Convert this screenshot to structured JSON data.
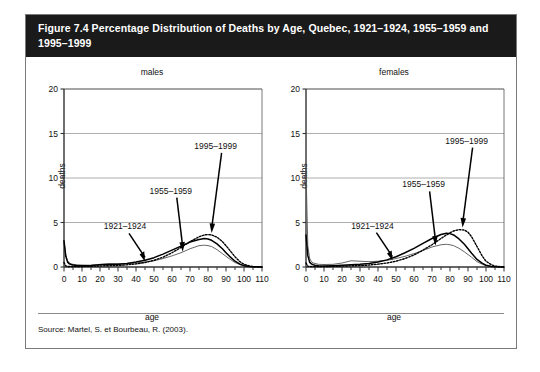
{
  "figure": {
    "title": "Figure 7.4 Percentage Distribution of Deaths by Age, Quebec, 1921–1924, 1955–1959 and 1995–1999",
    "source": "Source: Martel, S. et Bourbeau, R. (2003)."
  },
  "chart_data": [
    {
      "type": "line",
      "title": "males",
      "xlabel": "age",
      "ylabel": "deaths",
      "xlim": [
        0,
        110
      ],
      "ylim": [
        0,
        20
      ],
      "xticks": [
        0,
        10,
        20,
        30,
        40,
        50,
        60,
        70,
        80,
        90,
        100,
        110
      ],
      "yticks": [
        0,
        5,
        10,
        15,
        20
      ],
      "minor_xtick_step": 5,
      "grid": "horizontal",
      "legend_position": "annotations-with-arrows",
      "annotations": [
        {
          "label": "1921–1924",
          "points_to_age": 45,
          "points_to_value": 0.4
        },
        {
          "label": "1955–1959",
          "points_to_age": 66,
          "points_to_value": 1.5
        },
        {
          "label": "1995–1999",
          "points_to_age": 82,
          "points_to_value": 3.6
        }
      ],
      "x": [
        0,
        1,
        2,
        3,
        4,
        5,
        7,
        10,
        15,
        20,
        25,
        30,
        35,
        40,
        45,
        50,
        55,
        60,
        65,
        70,
        75,
        78,
        80,
        82,
        85,
        88,
        90,
        92,
        95,
        98,
        100,
        103,
        105,
        110
      ],
      "series": [
        {
          "name": "1921–1924",
          "style": "thin-gray",
          "values": [
            2.9,
            1.3,
            0.7,
            0.45,
            0.35,
            0.3,
            0.25,
            0.22,
            0.2,
            0.3,
            0.35,
            0.35,
            0.4,
            0.45,
            0.55,
            0.7,
            0.95,
            1.25,
            1.6,
            2.05,
            2.4,
            2.45,
            2.4,
            2.3,
            1.95,
            1.5,
            1.2,
            0.9,
            0.5,
            0.25,
            0.15,
            0.05,
            0.02,
            0.0
          ]
        },
        {
          "name": "1955–1959",
          "style": "solid-black",
          "values": [
            2.95,
            1.2,
            0.55,
            0.35,
            0.28,
            0.22,
            0.18,
            0.15,
            0.18,
            0.25,
            0.3,
            0.32,
            0.4,
            0.55,
            0.75,
            1.05,
            1.45,
            1.9,
            2.35,
            2.8,
            3.1,
            3.2,
            3.15,
            3.0,
            2.6,
            2.05,
            1.6,
            1.2,
            0.65,
            0.3,
            0.15,
            0.05,
            0.02,
            0.0
          ]
        },
        {
          "name": "1995–1999",
          "style": "dotted-black",
          "values": [
            0.5,
            0.12,
            0.07,
            0.05,
            0.05,
            0.05,
            0.05,
            0.06,
            0.08,
            0.12,
            0.15,
            0.18,
            0.25,
            0.35,
            0.5,
            0.75,
            1.1,
            1.6,
            2.2,
            2.85,
            3.4,
            3.6,
            3.65,
            3.6,
            3.35,
            2.85,
            2.4,
            1.9,
            1.15,
            0.55,
            0.3,
            0.12,
            0.05,
            0.0
          ]
        }
      ]
    },
    {
      "type": "line",
      "title": "females",
      "xlabel": "age",
      "ylabel": "deaths",
      "xlim": [
        0,
        110
      ],
      "ylim": [
        0,
        20
      ],
      "xticks": [
        0,
        10,
        20,
        30,
        40,
        50,
        60,
        70,
        80,
        90,
        100,
        110
      ],
      "yticks": [
        0,
        5,
        10,
        15,
        20
      ],
      "minor_xtick_step": 5,
      "grid": "horizontal",
      "legend_position": "annotations-with-arrows",
      "annotations": [
        {
          "label": "1921–1924",
          "points_to_age": 48,
          "points_to_value": 0.5
        },
        {
          "label": "1955–1959",
          "points_to_age": 72,
          "points_to_value": 2.2
        },
        {
          "label": "1995–1999",
          "points_to_age": 87,
          "points_to_value": 4.2
        }
      ],
      "x": [
        0,
        1,
        2,
        3,
        4,
        5,
        7,
        10,
        15,
        20,
        25,
        30,
        35,
        40,
        45,
        50,
        55,
        60,
        65,
        70,
        75,
        78,
        80,
        82,
        85,
        88,
        90,
        92,
        95,
        98,
        100,
        103,
        105,
        110
      ],
      "series": [
        {
          "name": "1921–1924",
          "style": "thin-gray",
          "values": [
            11.0,
            2.4,
            1.0,
            0.6,
            0.45,
            0.4,
            0.3,
            0.28,
            0.3,
            0.45,
            0.7,
            0.65,
            0.6,
            0.65,
            0.75,
            0.95,
            1.2,
            1.5,
            1.85,
            2.25,
            2.5,
            2.55,
            2.5,
            2.4,
            2.1,
            1.7,
            1.4,
            1.1,
            0.6,
            0.3,
            0.15,
            0.05,
            0.02,
            0.0
          ]
        },
        {
          "name": "1955–1959",
          "style": "solid-black",
          "values": [
            3.6,
            1.3,
            0.55,
            0.35,
            0.25,
            0.2,
            0.15,
            0.12,
            0.15,
            0.2,
            0.25,
            0.3,
            0.4,
            0.55,
            0.8,
            1.15,
            1.6,
            2.1,
            2.65,
            3.2,
            3.65,
            3.8,
            3.75,
            3.6,
            3.15,
            2.55,
            2.05,
            1.55,
            0.85,
            0.4,
            0.2,
            0.06,
            0.02,
            0.0
          ]
        },
        {
          "name": "1995–1999",
          "style": "dotted-black",
          "values": [
            0.45,
            0.1,
            0.06,
            0.05,
            0.04,
            0.04,
            0.04,
            0.05,
            0.07,
            0.1,
            0.13,
            0.16,
            0.22,
            0.32,
            0.45,
            0.65,
            0.95,
            1.35,
            1.9,
            2.5,
            3.2,
            3.6,
            3.85,
            4.05,
            4.2,
            4.15,
            3.9,
            3.4,
            2.3,
            1.2,
            0.65,
            0.25,
            0.1,
            0.0
          ]
        }
      ]
    }
  ]
}
